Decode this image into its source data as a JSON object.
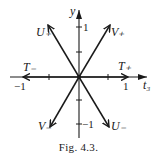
{
  "figure": {
    "caption": "Fig. 4.3.",
    "axes": {
      "x_label": "t₃",
      "y_label": "y",
      "x_tick_labels": {
        "neg": "−1",
        "pos": "1"
      },
      "y_tick_labels": {
        "pos": "1",
        "neg": "−1"
      }
    },
    "vectors": {
      "t_plus": "T₊",
      "t_minus": "T₋",
      "u_plus": "U₊",
      "u_minus": "U₋",
      "v_plus": "V₊",
      "v_minus": "V₋"
    },
    "colors": {
      "ink": "#1a1a1a",
      "background": "#ffffff"
    }
  }
}
